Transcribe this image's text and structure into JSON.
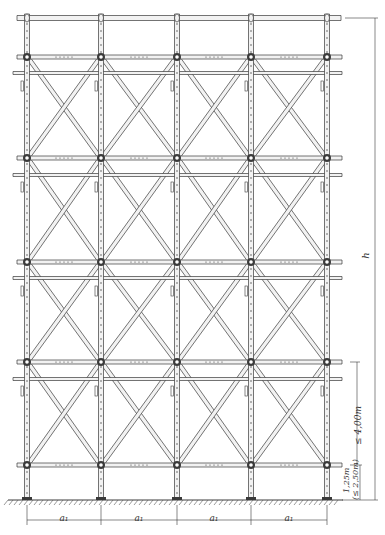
{
  "drawing": {
    "type": "scaffold-elevation",
    "colors": {
      "line": "#3a3a3a",
      "tube_fill": "#f2f2f2",
      "background": "#ffffff",
      "ground_hatch": "#555555"
    },
    "standards_x": [
      27,
      101,
      177,
      251,
      327
    ],
    "main_ledgers_y": [
      57,
      158,
      262,
      362,
      465
    ],
    "intermediate_ledgers_y": [
      73,
      175,
      278,
      379
    ],
    "top_rail_y": 18,
    "ground_y": 500,
    "bays": 4,
    "levels": 4
  },
  "dimensions": {
    "bay_width_label": "a₁",
    "bay_labels": [
      "a₁",
      "a₁",
      "a₁",
      "a₁"
    ],
    "height_label": "h",
    "lift_height_label": "≤ 4,00m",
    "base_lift_label": "1,25m",
    "base_lift_alt_label": "(≤ 2,50m)"
  }
}
